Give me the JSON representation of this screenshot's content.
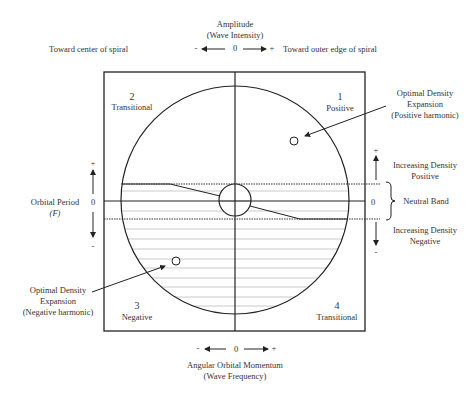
{
  "top_axis": {
    "title": "Amplitude",
    "subtitle": "(Wave Intensity)",
    "left_label": "Toward center of spiral",
    "right_label": "Toward outer edge of spiral",
    "minus": "-",
    "zero": "0",
    "plus": "+"
  },
  "left_axis": {
    "title": "Orbital Period",
    "symbol": "(F)",
    "plus": "+",
    "zero": "0",
    "minus": "-"
  },
  "bottom_axis": {
    "title": "Angular Orbital Momentum",
    "subtitle": "(Wave Frequency)",
    "minus": "-",
    "zero": "0",
    "plus": "+"
  },
  "quadrants": [
    {
      "number": "1",
      "label": "Positive"
    },
    {
      "number": "2",
      "label": "Transitional"
    },
    {
      "number": "3",
      "label": "Negative"
    },
    {
      "number": "4",
      "label": "Transitional"
    }
  ],
  "annotations": {
    "positive_expansion": [
      "Optimal Density",
      "Expansion",
      "(Positive harmonic)"
    ],
    "negative_expansion": [
      "Optimal Density",
      "Expansion",
      "(Negative harmonic)"
    ]
  },
  "right_scale": {
    "plus": "+",
    "zero": "0",
    "minus": "-",
    "increasing_positive": [
      "Increasing Density",
      "Positive"
    ],
    "neutral_band": "Neutral Band",
    "increasing_negative": [
      "Increasing Density",
      "Negative"
    ]
  },
  "colors": {
    "line": "#222222",
    "hatch": "#bbbbbb"
  }
}
